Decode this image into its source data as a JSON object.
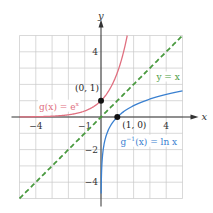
{
  "chart_data": {
    "type": "line",
    "title": "",
    "xlabel": "x",
    "ylabel": "y",
    "xlim": [
      -5,
      5
    ],
    "ylim": [
      -5,
      5
    ],
    "grid": true,
    "x_ticks": [
      {
        "value": -4,
        "label": "−4"
      },
      {
        "value": -1,
        "label": "−1"
      },
      {
        "value": 4,
        "label": "4"
      }
    ],
    "y_ticks": [
      {
        "value": 4,
        "label": "4"
      },
      {
        "value": -2,
        "label": "−2"
      },
      {
        "value": -4,
        "label": "−4"
      }
    ],
    "series": [
      {
        "name": "g(x) = e^x",
        "label_main": "g(x) = e",
        "label_sup": "x",
        "function": "exp",
        "color": "#e07080",
        "dash": false,
        "label_pos": [
          -3.8,
          0.45
        ]
      },
      {
        "name": "g^-1(x) = ln x",
        "label_main": "g",
        "label_sup": "−1",
        "label_rest": "(x) = ln x",
        "function": "ln",
        "color": "#3a80d0",
        "dash": false,
        "label_pos": [
          1.2,
          -1.7
        ]
      },
      {
        "name": "y = x",
        "label_main": "y = x",
        "function": "identity",
        "color": "#4a9a40",
        "dash": true,
        "label_pos": [
          3.4,
          2.3
        ]
      }
    ],
    "points": [
      {
        "x": 0,
        "y": 1,
        "label": "(0, 1)",
        "label_pos": [
          -1.6,
          1.6
        ]
      },
      {
        "x": 1,
        "y": 0,
        "label": "(1, 0)",
        "label_pos": [
          1.3,
          -0.65
        ]
      }
    ]
  },
  "layout": {
    "origin_px": [
      101,
      117
    ],
    "unit_px": 16.3
  }
}
